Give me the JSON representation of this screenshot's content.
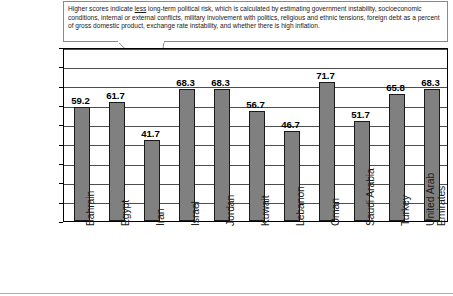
{
  "annotation": {
    "pre_text": "Higher scores indicate ",
    "emphasis": "less",
    "post_text": " long-term political risk, which is calculated by estimating government instability, socioeconomic conditions, internal or external conflicts, military involvement with politics, religious and ethnic tensions, foreign debt as a percent of gross domestic product, exchange rate instability, and whether there is high inflation."
  },
  "chart_data": {
    "type": "bar",
    "title": "",
    "xlabel": "",
    "ylabel": "Long-Term Political Stability",
    "ylim": [
      0,
      90
    ],
    "ytick_step": 10,
    "yticks": [
      0,
      10,
      20,
      30,
      40,
      50,
      60,
      70,
      80,
      90
    ],
    "grid": true,
    "legend": "none",
    "bar_color": "#808080",
    "bar_edge_color": "#1a1a1a",
    "categories": [
      "Bahrain",
      "Egypt",
      "Iran",
      "Israel",
      "Jordan",
      "Kuwait",
      "Lebanon",
      "Oman",
      "Saudi Arabia",
      "Turkey",
      "United Arab\nEmirates"
    ],
    "values": [
      59.2,
      61.7,
      41.7,
      68.3,
      68.3,
      56.7,
      46.7,
      71.7,
      51.7,
      65.8,
      68.3
    ],
    "data_labels": [
      "59.2",
      "61.7",
      "41.7",
      "68.3",
      "68.3",
      "56.7",
      "46.7",
      "71.7",
      "51.7",
      "65.8",
      "68.3"
    ]
  }
}
